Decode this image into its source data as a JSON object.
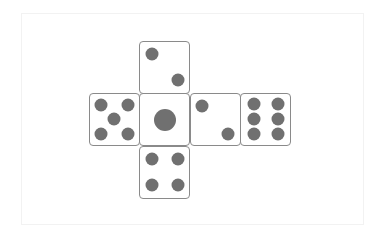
{
  "diagram": {
    "title": "",
    "type": "dice-net",
    "colors": {
      "pip": "#707070",
      "border": "#8a8a8a",
      "face_bg": "#ffffff"
    },
    "faces": [
      {
        "id": "top",
        "value": 2,
        "row": 0,
        "col": 1
      },
      {
        "id": "left",
        "value": 5,
        "row": 1,
        "col": 0
      },
      {
        "id": "center",
        "value": 1,
        "row": 1,
        "col": 1
      },
      {
        "id": "right",
        "value": 2,
        "row": 1,
        "col": 2
      },
      {
        "id": "far-right",
        "value": 6,
        "row": 1,
        "col": 3
      },
      {
        "id": "bottom",
        "value": 4,
        "row": 2,
        "col": 1
      }
    ]
  }
}
